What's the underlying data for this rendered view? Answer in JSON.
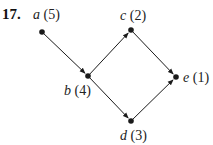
{
  "problem_number": "17.",
  "nodes": [
    {
      "id": "a",
      "weight": "(5)"
    },
    {
      "id": "b",
      "weight": "(4)"
    },
    {
      "id": "c",
      "weight": "(2)"
    },
    {
      "id": "d",
      "weight": "(3)"
    },
    {
      "id": "e",
      "weight": "(1)"
    }
  ],
  "edges": [
    {
      "from": "a",
      "to": "b"
    },
    {
      "from": "b",
      "to": "c"
    },
    {
      "from": "b",
      "to": "d"
    },
    {
      "from": "c",
      "to": "e"
    },
    {
      "from": "d",
      "to": "e"
    }
  ],
  "colors": {
    "ink": "#1a1a1a"
  }
}
